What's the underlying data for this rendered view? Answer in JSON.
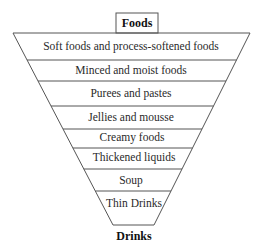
{
  "diagram": {
    "top_label": "Foods",
    "bottom_label": "Drinks",
    "levels": [
      {
        "label": "Soft foods and process-softened foods"
      },
      {
        "label": "Minced and moist foods"
      },
      {
        "label": "Purees and pastes"
      },
      {
        "label": "Jellies and mousse"
      },
      {
        "label": "Creamy foods"
      },
      {
        "label": "Thickened liquids"
      },
      {
        "label": "Soup"
      },
      {
        "label": "Thin Drinks"
      }
    ],
    "colors": {
      "line": "#555555",
      "text": "#2a2a2a",
      "background": "#ffffff"
    }
  }
}
